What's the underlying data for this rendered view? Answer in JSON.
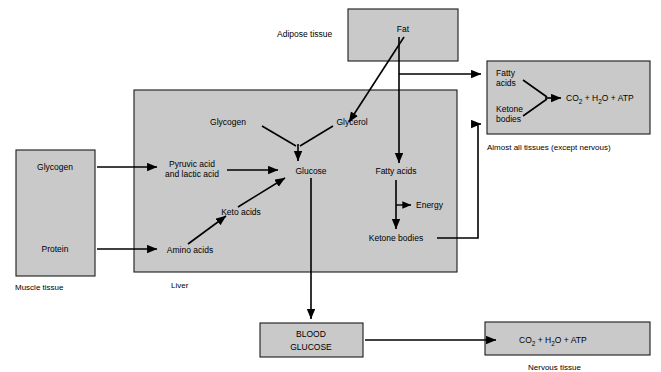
{
  "diagram": {
    "type": "flow-diagram",
    "colors": {
      "box_fill": "#c9c9c9",
      "box_stroke": "#1a1a1a",
      "arrow": "#000000",
      "background": "#ffffff"
    }
  },
  "adipose": {
    "caption": "Adipose tissue",
    "fat_label": "Fat"
  },
  "muscle": {
    "caption": "Muscle tissue",
    "glycogen_label": "Glycogen",
    "protein_label": "Protein"
  },
  "liver": {
    "caption": "Liver",
    "glycogen_label": "Glycogen",
    "glycerol_label": "Glycerol",
    "pyruvic_line1": "Pyruvic acid",
    "pyruvic_line2": "and lactic acid",
    "glucose_label": "Glucose",
    "keto_acids_label": "Keto acids",
    "amino_acids_label": "Amino acids",
    "fatty_acids_label": "Fatty acids",
    "energy_label": "Energy",
    "ketone_bodies_label": "Ketone bodies"
  },
  "all_tissues": {
    "caption": "Almost all tissues (except nervous)",
    "fatty_acids_line1": "Fatty",
    "fatty_acids_line2": "acids",
    "ketone_line1": "Ketone",
    "ketone_line2": "bodies",
    "products": {
      "co2": "CO",
      "co2_sub": "2",
      "plus1": "+",
      "h2o": "H",
      "h2o_sub": "2",
      "h2o_rest": "O",
      "plus2": "+",
      "atp": "ATP"
    }
  },
  "blood": {
    "line1": "BLOOD",
    "line2": "GLUCOSE"
  },
  "nervous": {
    "caption": "Nervous tissue",
    "products": {
      "co2": "CO",
      "co2_sub": "2",
      "plus1": "+",
      "h2o": "H",
      "h2o_sub": "2",
      "h2o_rest": "O",
      "plus2": "+",
      "atp": "ATP"
    }
  }
}
